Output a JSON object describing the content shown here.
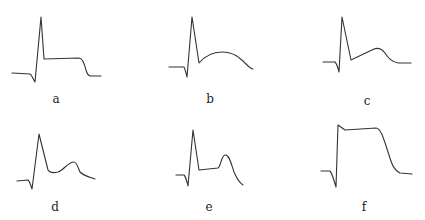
{
  "panels": [
    {
      "id": "a",
      "label": "a",
      "description": "action potential with spike and flat plateau",
      "label_pos": [
        56,
        94
      ],
      "path": "M12,73 L30,74 C32,75 33,79 35,82 L41,17 L44,59 L79,58 C82,58 84,62 86,70 C87,74 88,76 91,76 L101,76"
    },
    {
      "id": "b",
      "label": "b",
      "description": "spike followed by broad rounded hump",
      "label_pos": [
        210,
        94
      ],
      "path": "M169,67 L184,67 C185,69 186,73 187,77 L192,17 L199,63 C205,56 213,52 222,52 C234,52 240,58 246,64 C249,67 251,69 253,69"
    },
    {
      "id": "c",
      "label": "c",
      "description": "spike followed by rising ramp and hump",
      "label_pos": [
        367,
        96
      ],
      "path": "M323,62 L335,62 C337,64 338,68 339,72 L342,17 L351,60 L374,49 C379,47 382,49 385,53 C388,58 392,62 398,63 L411,63"
    },
    {
      "id": "d",
      "label": "d",
      "description": "spike, trough, and smaller secondary hump",
      "label_pos": [
        55,
        202
      ],
      "path": "M17,181 L28,180 C30,182 31,186 32,189 L39,134 L48,170 C50,173 54,173 58,172 C64,170 68,162 74,162 C77,162 78,168 80,172 C84,176 89,177 95,179"
    },
    {
      "id": "e",
      "label": "e",
      "description": "spike, low plateau, then late narrow hump",
      "label_pos": [
        209,
        202
      ],
      "path": "M176,175 L184,175 C186,177 187,182 188,186 L193,130 L199,170 L218,168 C221,166 221,156 225,155 C229,154 231,163 234,172 C237,179 240,183 243,185"
    },
    {
      "id": "f",
      "label": "f",
      "description": "tall square-wave action potential with prolonged plateau",
      "label_pos": [
        364,
        202
      ],
      "path": "M321,171 L330,171 C332,173 334,180 336,187 L338,125 L345,130 L376,128 C381,128 384,140 389,155 C392,165 394,170 400,173 L412,174"
    }
  ]
}
